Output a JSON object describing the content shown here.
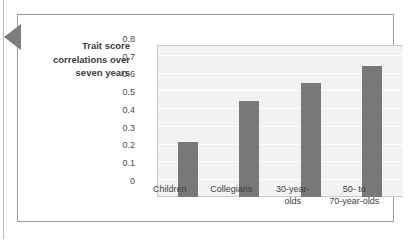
{
  "figure": {
    "pointer_marker": "left-triangle-marker"
  },
  "chart_data": {
    "type": "bar",
    "title": "",
    "xlabel": "",
    "ylabel": "Trait score correlations over seven years",
    "ylabel_lines": [
      "Trait score",
      "correlations over",
      "seven years"
    ],
    "categories": [
      "Children",
      "Collegians",
      "30-year-olds",
      "50- to 70-year-olds"
    ],
    "category_lines": [
      [
        "Children"
      ],
      [
        "Collegians"
      ],
      [
        "30-year-",
        "olds"
      ],
      [
        "50-  to",
        "70-year-olds"
      ]
    ],
    "values": [
      0.31,
      0.54,
      0.64,
      0.74
    ],
    "ylim": [
      0,
      0.85
    ],
    "yticks": [
      0,
      0.1,
      0.2,
      0.3,
      0.4,
      0.5,
      0.6,
      0.7,
      0.8
    ],
    "ytick_labels": [
      "0",
      "0.1",
      "0.2",
      "0.3",
      "0.4",
      "0.5",
      "0.6",
      "0.7",
      "0.8"
    ],
    "grid": true,
    "legend": false,
    "bar_color": "#77787a",
    "plot_background": "#f2f2f2",
    "gridline_color": "#ffffff"
  }
}
